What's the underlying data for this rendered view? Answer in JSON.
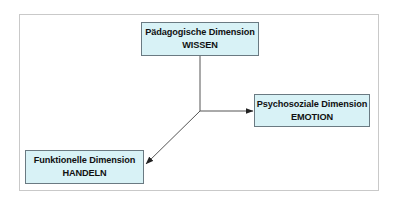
{
  "diagram": {
    "nodes": [
      {
        "id": "paedagogisch",
        "title": "Pädagogische Dimension",
        "subtitle": "WISSEN"
      },
      {
        "id": "psychosozial",
        "title": "Psychosoziale Dimension",
        "subtitle": "EMOTION"
      },
      {
        "id": "funktionell",
        "title": "Funktionelle Dimension",
        "subtitle": "HANDELN"
      }
    ],
    "edges": [
      {
        "from": "paedagogisch",
        "to": "psychosozial",
        "style": "arrow"
      },
      {
        "from": "paedagogisch",
        "to": "funktionell",
        "style": "arrow"
      }
    ],
    "colors": {
      "node_fill": "#d8f2f6",
      "node_border": "#6a7a82",
      "line": "#555555",
      "frame": "#c9c9c9"
    }
  }
}
